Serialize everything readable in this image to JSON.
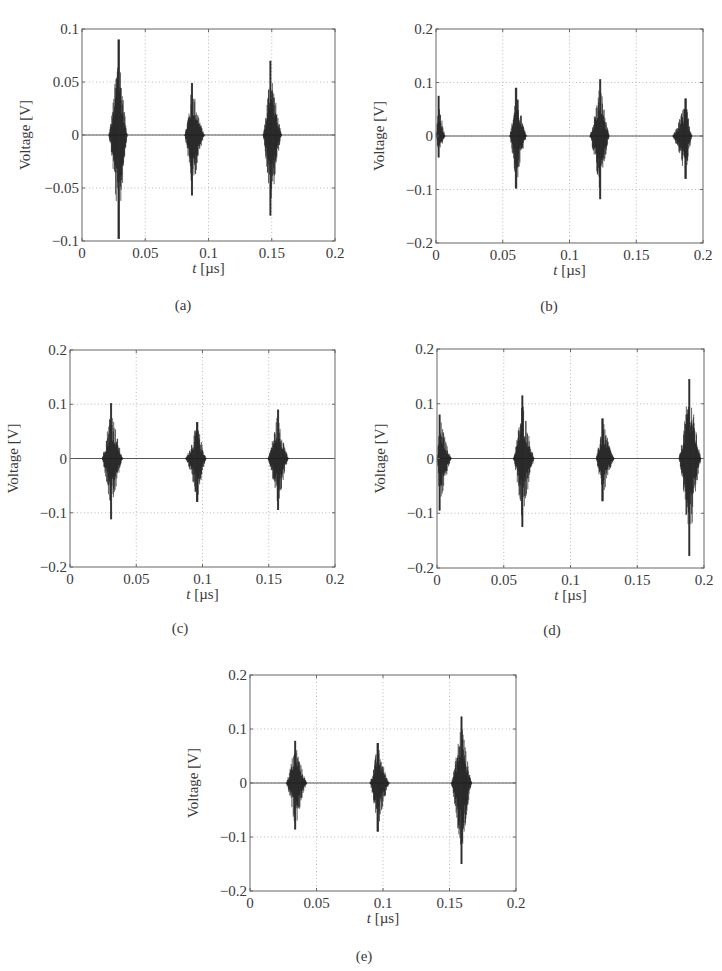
{
  "figure": {
    "panels": [
      {
        "id": "a",
        "caption": "(a)",
        "caption_pos": [
          183,
          297
        ],
        "frame": [
          82,
          29,
          335,
          241
        ]
      },
      {
        "id": "b",
        "caption": "(b)",
        "caption_pos": [
          549,
          298
        ],
        "frame": [
          436,
          29,
          703,
          243
        ]
      },
      {
        "id": "c",
        "caption": "(c)",
        "caption_pos": [
          180,
          620
        ],
        "frame": [
          70,
          350,
          335,
          567
        ]
      },
      {
        "id": "d",
        "caption": "(d)",
        "caption_pos": [
          552,
          622
        ],
        "frame": [
          437,
          349,
          704,
          568
        ]
      },
      {
        "id": "e",
        "caption": "(e)",
        "caption_pos": [
          364,
          948
        ],
        "frame": [
          250,
          675,
          516,
          891
        ]
      }
    ]
  },
  "chart_data": [
    {
      "panel": "a",
      "type": "line",
      "title": "",
      "caption": "(a)",
      "xlabel": "t [µs]",
      "ylabel": "Voltage [V]",
      "xlim": [
        0,
        0.2
      ],
      "ylim": [
        -0.1,
        0.1
      ],
      "xticks": [
        "0",
        "0.05",
        "0.1",
        "0.15",
        "0.2"
      ],
      "yticks": [
        "-0.1",
        "-0.05",
        "0",
        "0.05",
        "0.1"
      ],
      "grid": true,
      "bursts": [
        {
          "t_start": 0.021,
          "t_peak": 0.029,
          "t_end": 0.036,
          "v_max": 0.09,
          "v_min": -0.098
        },
        {
          "t_start": 0.081,
          "t_peak": 0.087,
          "t_end": 0.097,
          "v_max": 0.049,
          "v_min": -0.057
        },
        {
          "t_start": 0.143,
          "t_peak": 0.149,
          "t_end": 0.158,
          "v_max": 0.07,
          "v_min": -0.076
        }
      ]
    },
    {
      "panel": "b",
      "type": "line",
      "title": "",
      "caption": "(b)",
      "xlabel": "t [µs]",
      "ylabel": "Voltage [V]",
      "xlim": [
        0,
        0.2
      ],
      "ylim": [
        -0.2,
        0.2
      ],
      "xticks": [
        "0",
        "0.05",
        "0.1",
        "0.15",
        "0.2"
      ],
      "yticks": [
        "-0.2",
        "-0.1",
        "0",
        "0.1",
        "0.2"
      ],
      "grid": true,
      "bursts": [
        {
          "t_start": 0.0,
          "t_peak": 0.002,
          "t_end": 0.007,
          "v_max": 0.075,
          "v_min": -0.04
        },
        {
          "t_start": 0.055,
          "t_peak": 0.06,
          "t_end": 0.068,
          "v_max": 0.09,
          "v_min": -0.098
        },
        {
          "t_start": 0.115,
          "t_peak": 0.123,
          "t_end": 0.13,
          "v_max": 0.106,
          "v_min": -0.118
        },
        {
          "t_start": 0.177,
          "t_peak": 0.187,
          "t_end": 0.192,
          "v_max": 0.07,
          "v_min": -0.08
        }
      ]
    },
    {
      "panel": "c",
      "type": "line",
      "title": "",
      "caption": "(c)",
      "xlabel": "t [µs]",
      "ylabel": "Voltage [V]",
      "xlim": [
        0,
        0.2
      ],
      "ylim": [
        -0.2,
        0.2
      ],
      "xticks": [
        "0",
        "0.05",
        "0.1",
        "0.15",
        "0.2"
      ],
      "yticks": [
        "-0.2",
        "-0.1",
        "0",
        "0.1",
        "0.2"
      ],
      "grid": true,
      "bursts": [
        {
          "t_start": 0.024,
          "t_peak": 0.031,
          "t_end": 0.04,
          "v_max": 0.102,
          "v_min": -0.112
        },
        {
          "t_start": 0.087,
          "t_peak": 0.096,
          "t_end": 0.103,
          "v_max": 0.067,
          "v_min": -0.08
        },
        {
          "t_start": 0.149,
          "t_peak": 0.157,
          "t_end": 0.165,
          "v_max": 0.09,
          "v_min": -0.095
        }
      ]
    },
    {
      "panel": "d",
      "type": "line",
      "title": "",
      "caption": "(d)",
      "xlabel": "t [µs]",
      "ylabel": "Voltage [V]",
      "xlim": [
        0,
        0.2
      ],
      "ylim": [
        -0.2,
        0.2
      ],
      "xticks": [
        "0",
        "0.05",
        "0.1",
        "0.15",
        "0.2"
      ],
      "yticks": [
        "-0.2",
        "-0.1",
        "0",
        "0.1",
        "0.2"
      ],
      "grid": true,
      "bursts": [
        {
          "t_start": 0.0,
          "t_peak": 0.002,
          "t_end": 0.011,
          "v_max": 0.08,
          "v_min": -0.095
        },
        {
          "t_start": 0.057,
          "t_peak": 0.064,
          "t_end": 0.073,
          "v_max": 0.115,
          "v_min": -0.125
        },
        {
          "t_start": 0.119,
          "t_peak": 0.124,
          "t_end": 0.133,
          "v_max": 0.073,
          "v_min": -0.078
        },
        {
          "t_start": 0.181,
          "t_peak": 0.189,
          "t_end": 0.198,
          "v_max": 0.145,
          "v_min": -0.178
        }
      ]
    },
    {
      "panel": "e",
      "type": "line",
      "title": "",
      "caption": "(e)",
      "xlabel": "t [µs]",
      "ylabel": "Voltage [V]",
      "xlim": [
        0,
        0.2
      ],
      "ylim": [
        -0.2,
        0.2
      ],
      "xticks": [
        "0",
        "0.05",
        "0.1",
        "0.15",
        "0.2"
      ],
      "yticks": [
        "-0.2",
        "-0.1",
        "0",
        "0.1",
        "0.2"
      ],
      "grid": true,
      "bursts": [
        {
          "t_start": 0.027,
          "t_peak": 0.034,
          "t_end": 0.043,
          "v_max": 0.078,
          "v_min": -0.086
        },
        {
          "t_start": 0.09,
          "t_peak": 0.096,
          "t_end": 0.105,
          "v_max": 0.074,
          "v_min": -0.09
        },
        {
          "t_start": 0.151,
          "t_peak": 0.159,
          "t_end": 0.167,
          "v_max": 0.123,
          "v_min": -0.15
        }
      ]
    }
  ]
}
